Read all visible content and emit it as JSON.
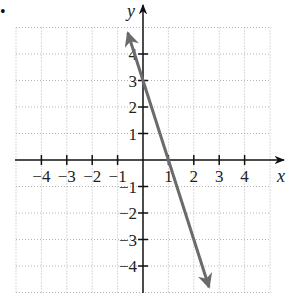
{
  "chart_data": {
    "type": "line",
    "title": "",
    "xlabel": "x",
    "ylabel": "y",
    "xlim": [
      -5,
      5
    ],
    "ylim": [
      -5,
      5
    ],
    "grid": true,
    "grid_style": "dotted",
    "x_ticks": [
      -4,
      -3,
      -2,
      -1,
      1,
      2,
      3,
      4
    ],
    "y_ticks": [
      -4,
      -3,
      -2,
      -1,
      1,
      2,
      3,
      4
    ],
    "x_tick_labels": [
      "−4",
      "−3",
      "−2",
      "−1",
      "1",
      "2",
      "3",
      "4"
    ],
    "y_tick_labels": [
      "−4",
      "−3",
      "−2",
      "−1",
      "1",
      "2",
      "3",
      "4"
    ],
    "series": [
      {
        "name": "y = -3x + 3",
        "equation": "y = -3x + 3",
        "slope": -3,
        "y_intercept": 3,
        "x_intercept": 1,
        "x": [
          -0.6,
          2.6
        ],
        "y": [
          4.8,
          -4.8
        ],
        "arrows": "both",
        "color": "#6b6b6b"
      }
    ]
  },
  "marker": {
    "bullet": "•"
  }
}
